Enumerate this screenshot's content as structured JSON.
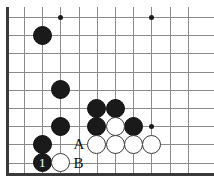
{
  "figure": {
    "kind": "go-board-diagram",
    "board": {
      "origin_x": 24,
      "origin_y": 17,
      "spacing": 18.2,
      "columns": 10,
      "rows": 9,
      "line_color": "#8a8a8a",
      "edge_color": "#3a3a3a",
      "background": "#ffffff"
    },
    "star_points": [
      {
        "col": 2,
        "row": 0
      },
      {
        "col": 7,
        "row": 0
      },
      {
        "col": 7,
        "row": 6
      }
    ],
    "stones": [
      {
        "col": 1,
        "row": 1,
        "color": "black",
        "label": ""
      },
      {
        "col": 2,
        "row": 4,
        "color": "black",
        "label": ""
      },
      {
        "col": 2,
        "row": 6,
        "color": "black",
        "label": ""
      },
      {
        "col": 4,
        "row": 5,
        "color": "black",
        "label": ""
      },
      {
        "col": 5,
        "row": 5,
        "color": "black",
        "label": ""
      },
      {
        "col": 4,
        "row": 6,
        "color": "black",
        "label": ""
      },
      {
        "col": 6,
        "row": 6,
        "color": "black",
        "label": ""
      },
      {
        "col": 5,
        "row": 6,
        "color": "white",
        "label": ""
      },
      {
        "col": 4,
        "row": 7,
        "color": "white",
        "label": ""
      },
      {
        "col": 5,
        "row": 7,
        "color": "white",
        "label": ""
      },
      {
        "col": 6,
        "row": 7,
        "color": "white",
        "label": ""
      },
      {
        "col": 7,
        "row": 7,
        "color": "white",
        "label": ""
      },
      {
        "col": 1,
        "row": 7,
        "color": "black",
        "label": ""
      },
      {
        "col": 1,
        "row": 8,
        "color": "black",
        "label": "1"
      },
      {
        "col": 2,
        "row": 8,
        "color": "white",
        "label": ""
      }
    ],
    "point_labels": [
      {
        "text": "A",
        "col": 3,
        "row": 7
      },
      {
        "text": "B",
        "col": 3,
        "row": 8
      }
    ],
    "corner_mark": ""
  }
}
